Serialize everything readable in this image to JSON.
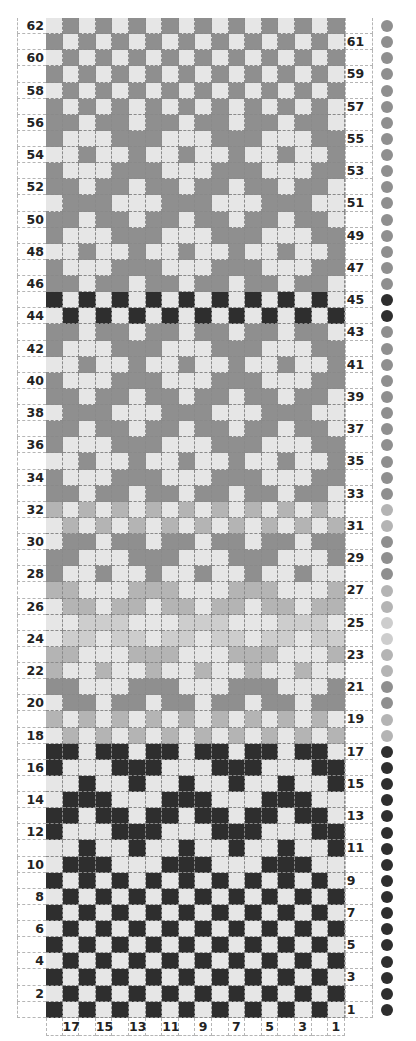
{
  "chart_data": {
    "type": "table",
    "columns": 18,
    "rows": 62,
    "column_labels": [
      "",
      "17",
      "",
      "15",
      "",
      "13",
      "",
      "11",
      "",
      "9",
      "",
      "7",
      "",
      "5",
      "",
      "3",
      "",
      "1"
    ],
    "left_row_labels_even": [
      62,
      60,
      58,
      56,
      54,
      52,
      50,
      48,
      46,
      44,
      42,
      40,
      38,
      36,
      34,
      32,
      30,
      28,
      26,
      24,
      22,
      20,
      18,
      16,
      14,
      12,
      10,
      8,
      6,
      4,
      2
    ],
    "right_row_labels_odd": [
      61,
      59,
      57,
      55,
      53,
      51,
      49,
      47,
      45,
      43,
      41,
      39,
      37,
      35,
      33,
      31,
      29,
      27,
      25,
      23,
      21,
      19,
      17,
      15,
      13,
      11,
      9,
      7,
      5,
      3,
      1
    ],
    "palette": {
      "background": "#e6e6e6",
      "gray": "#8f8f8f",
      "black": "#2e2e2e",
      "light": "#b4b4b4",
      "verylight": "#cdcdcd"
    },
    "row_patterns_top_to_bottom": [
      {
        "row": 62,
        "color": "gray",
        "pattern": "010101010101010101"
      },
      {
        "row": 61,
        "color": "gray",
        "pattern": "101010101010101010"
      },
      {
        "row": 60,
        "color": "gray",
        "pattern": "010101010101010101"
      },
      {
        "row": 59,
        "color": "gray",
        "pattern": "101010101010101010"
      },
      {
        "row": 58,
        "color": "gray",
        "pattern": "010101010101010101"
      },
      {
        "row": 57,
        "color": "gray",
        "pattern": "101010101010101010"
      },
      {
        "row": 56,
        "color": "gray",
        "pattern": "110110110110110110"
      },
      {
        "row": 55,
        "color": "gray",
        "pattern": "100011100011100011"
      },
      {
        "row": 54,
        "color": "gray",
        "pattern": "001001001001001001"
      },
      {
        "row": 53,
        "color": "gray",
        "pattern": "100011100011100011"
      },
      {
        "row": 52,
        "color": "gray",
        "pattern": "110110110110110110"
      },
      {
        "row": 51,
        "color": "gray",
        "pattern": "011100011100011100"
      },
      {
        "row": 50,
        "color": "gray",
        "pattern": "110110110110110110"
      },
      {
        "row": 49,
        "color": "gray",
        "pattern": "100011100011100011"
      },
      {
        "row": 48,
        "color": "gray",
        "pattern": "001001001001001001"
      },
      {
        "row": 47,
        "color": "gray",
        "pattern": "100011100011100011"
      },
      {
        "row": 46,
        "color": "gray",
        "pattern": "110110110110110110"
      },
      {
        "row": 45,
        "color": "black",
        "pattern": "101010101010101010"
      },
      {
        "row": 44,
        "color": "black",
        "pattern": "010101010101010101"
      },
      {
        "row": 43,
        "color": "gray",
        "pattern": "110110110110110110"
      },
      {
        "row": 42,
        "color": "gray",
        "pattern": "100011100011100011"
      },
      {
        "row": 41,
        "color": "gray",
        "pattern": "001001001001001001"
      },
      {
        "row": 40,
        "color": "gray",
        "pattern": "100011100011100011"
      },
      {
        "row": 39,
        "color": "gray",
        "pattern": "110110110110110110"
      },
      {
        "row": 38,
        "color": "gray",
        "pattern": "011100011100011100"
      },
      {
        "row": 37,
        "color": "gray",
        "pattern": "110110110110110110"
      },
      {
        "row": 36,
        "color": "gray",
        "pattern": "100011100011100011"
      },
      {
        "row": 35,
        "color": "gray",
        "pattern": "001001001001001001"
      },
      {
        "row": 34,
        "color": "gray",
        "pattern": "100011100011100011"
      },
      {
        "row": 33,
        "color": "gray",
        "pattern": "110110110110110110"
      },
      {
        "row": 32,
        "color": "light",
        "pattern": "101010101010101010"
      },
      {
        "row": 31,
        "color": "light",
        "pattern": "010101010101010101"
      },
      {
        "row": 30,
        "color": "gray",
        "pattern": "011011011011011011"
      },
      {
        "row": 29,
        "color": "gray",
        "pattern": "110001110001110001"
      },
      {
        "row": 28,
        "color": "gray",
        "pattern": "100100100100100100"
      },
      {
        "row": 27,
        "color": "light",
        "pattern": "110001110001110001"
      },
      {
        "row": 26,
        "color": "light",
        "pattern": "011011011011011011"
      },
      {
        "row": 25,
        "color": "verylight",
        "pattern": "001110001110001110"
      },
      {
        "row": 24,
        "color": "verylight",
        "pattern": "011011011011011011"
      },
      {
        "row": 23,
        "color": "light",
        "pattern": "110001110001110001"
      },
      {
        "row": 22,
        "color": "light",
        "pattern": "100100100100100100"
      },
      {
        "row": 21,
        "color": "gray",
        "pattern": "110001110001110001"
      },
      {
        "row": 20,
        "color": "gray",
        "pattern": "011011011011011011"
      },
      {
        "row": 19,
        "color": "light",
        "pattern": "101010101010101010"
      },
      {
        "row": 18,
        "color": "light",
        "pattern": "010101010101010101"
      },
      {
        "row": 17,
        "color": "black",
        "pattern": "110110110110110110"
      },
      {
        "row": 16,
        "color": "black",
        "pattern": "100011100011100011"
      },
      {
        "row": 15,
        "color": "black",
        "pattern": "001001001001001001"
      },
      {
        "row": 14,
        "color": "black",
        "pattern": "011100011100011100"
      },
      {
        "row": 13,
        "color": "black",
        "pattern": "110110110110110110"
      },
      {
        "row": 12,
        "color": "black",
        "pattern": "100011100011100011"
      },
      {
        "row": 11,
        "color": "black",
        "pattern": "001001001001001001"
      },
      {
        "row": 10,
        "color": "black",
        "pattern": "011100011100011100"
      },
      {
        "row": 9,
        "color": "black",
        "pattern": "101010101010101010"
      },
      {
        "row": 8,
        "color": "black",
        "pattern": "010101010101010101"
      },
      {
        "row": 7,
        "color": "black",
        "pattern": "101010101010101010"
      },
      {
        "row": 6,
        "color": "black",
        "pattern": "010101010101010101"
      },
      {
        "row": 5,
        "color": "black",
        "pattern": "101010101010101010"
      },
      {
        "row": 4,
        "color": "black",
        "pattern": "010101010101010101"
      },
      {
        "row": 3,
        "color": "black",
        "pattern": "101010101010101010"
      },
      {
        "row": 2,
        "color": "black",
        "pattern": "010101010101010101"
      },
      {
        "row": 1,
        "color": "black",
        "pattern": "101010101010101010"
      }
    ],
    "legend_dots": "one color dot per row at right edge, matching row contrast color"
  }
}
